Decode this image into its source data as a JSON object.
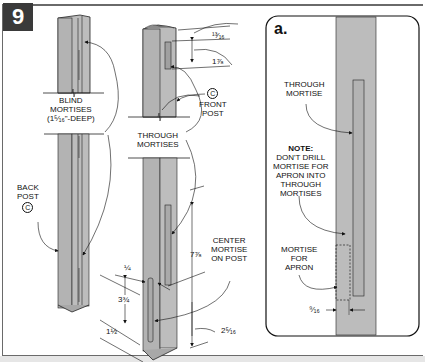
{
  "figure": {
    "number": "9",
    "colors": {
      "post_fill": "#b9b9b9",
      "post_shade": "#a6a6a6",
      "line": "#222222",
      "badge": "#3a3a3a"
    }
  },
  "main_view": {
    "back_post": {
      "label_lines": [
        "BACK",
        "POST"
      ],
      "callout_mark": "C"
    },
    "blind_mortises": {
      "label_lines": [
        "BLIND",
        "MORTISES",
        "(1⁵⁄₁₆\"-DEEP)"
      ]
    },
    "front_post": {
      "label_lines": [
        "FRONT",
        "POST"
      ],
      "callout_mark": "C"
    },
    "through_mortises": {
      "label_lines": [
        "THROUGH",
        "MORTISES"
      ]
    },
    "center_mortise": {
      "label_lines": [
        "CENTER",
        "MORTISE",
        "ON POST"
      ]
    },
    "dimensions": {
      "top_offset": "¹³⁄₁₆",
      "top_mortise_length": "1⅞",
      "long_mortise": "7⅞",
      "edge_offset": "¼",
      "short_mortise": "3¾",
      "bottom_offset": "1½",
      "bottom_spacing": "2⁵⁄₁₆"
    }
  },
  "inset": {
    "title": "a.",
    "through_mortise_label": [
      "THROUGH",
      "MORTISE"
    ],
    "note_heading": "NOTE:",
    "note_lines": [
      "DON'T DRILL",
      "MORTISE FOR",
      "APRON INTO",
      "THROUGH",
      "MORTISES"
    ],
    "apron_mortise_label": [
      "MORTISE",
      "FOR",
      "APRON"
    ],
    "offset_dimension": "⁹⁄₁₆"
  }
}
